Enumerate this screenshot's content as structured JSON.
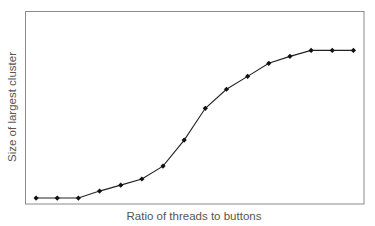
{
  "chart_data": {
    "type": "line",
    "title": "",
    "xlabel": "Ratio of threads to buttons",
    "ylabel": "Size of largest cluster",
    "x": [
      1,
      2,
      3,
      4,
      5,
      6,
      7,
      8,
      9,
      10,
      11,
      12,
      13,
      14,
      15,
      16
    ],
    "series": [
      {
        "name": "Largest cluster",
        "values": [
          3.1,
          3.1,
          3.1,
          6.7,
          9.8,
          13.0,
          19.7,
          33.2,
          49.7,
          59.6,
          66.3,
          73.1,
          76.7,
          79.8,
          79.8,
          79.8
        ],
        "marker": "diamond",
        "color": "#111111"
      }
    ],
    "xlim": [
      0.5,
      16.5
    ],
    "ylim": [
      0,
      100
    ],
    "ticks": "none",
    "grid": false,
    "legend": "none",
    "frame_color": "#8a8a8a"
  }
}
